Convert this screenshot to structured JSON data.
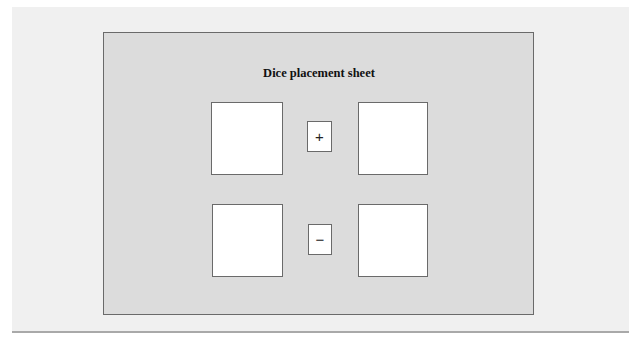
{
  "sheet": {
    "title": "Dice placement sheet",
    "rows": [
      {
        "left_slot": "",
        "operator": "+",
        "operator_name": "plus",
        "right_slot": ""
      },
      {
        "left_slot": "",
        "operator": "−",
        "operator_name": "minus",
        "right_slot": ""
      }
    ]
  },
  "colors": {
    "page_background": "#ffffff",
    "outer_panel": "#f0f0f0",
    "sheet_fill": "#dcdcdc",
    "border": "#6a6a6a",
    "slot_fill": "#ffffff"
  }
}
